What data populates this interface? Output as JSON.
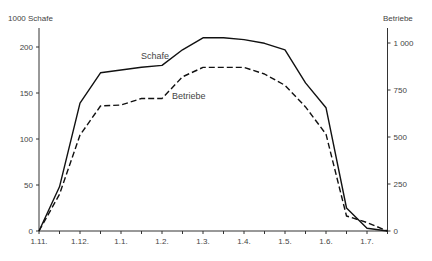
{
  "chart_data": {
    "type": "line",
    "title": "",
    "xlabel": "",
    "ylabel_left": "1000 Schafe",
    "ylabel_right": "Betriebe",
    "x_tick_labels": [
      "1.11.",
      "1.12.",
      "1.1.",
      "1.2.",
      "1.3.",
      "1.4.",
      "1.5.",
      "1.6.",
      "1.7."
    ],
    "x": [
      0,
      0.5,
      1,
      1.5,
      2,
      2.5,
      3,
      3.5,
      4,
      4.5,
      5,
      5.5,
      6,
      6.5,
      7,
      7.5,
      8,
      8.5
    ],
    "left_ticks": [
      0,
      50,
      100,
      150,
      200
    ],
    "right_ticks": [
      0,
      250,
      500,
      750,
      1000
    ],
    "ylim_left": [
      0,
      220
    ],
    "ylim_right": [
      0,
      1100
    ],
    "grid": false,
    "legend": "inline labels",
    "series": [
      {
        "name": "Schafe",
        "axis": "left",
        "style": "solid",
        "values": [
          0,
          48,
          139,
          172,
          175,
          178,
          180,
          197,
          210,
          210,
          208,
          204,
          197,
          161,
          134,
          25,
          3,
          0
        ]
      },
      {
        "name": "Betriebe",
        "axis": "right",
        "style": "dashed",
        "values": [
          0,
          195,
          510,
          665,
          670,
          705,
          705,
          820,
          870,
          870,
          870,
          835,
          775,
          660,
          515,
          80,
          45,
          0
        ]
      }
    ]
  }
}
